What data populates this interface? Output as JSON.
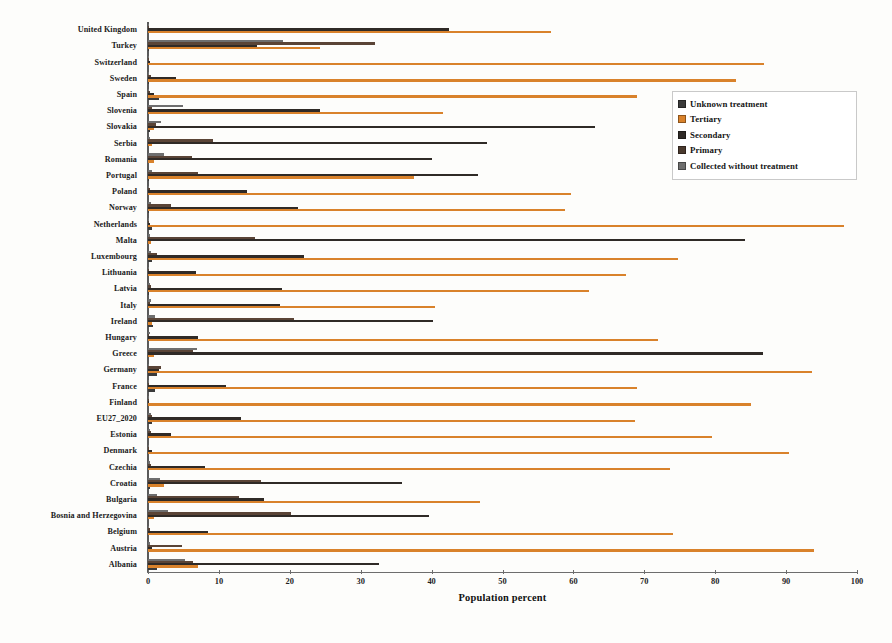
{
  "chart_data": {
    "type": "bar",
    "orientation": "horizontal",
    "title": "",
    "xlabel": "Population percent",
    "ylabel": "",
    "xlim": [
      0,
      100
    ],
    "xticks": [
      0,
      10,
      20,
      30,
      40,
      50,
      60,
      70,
      80,
      90,
      100
    ],
    "grid": false,
    "legend_position": "upper right",
    "colors": {
      "Unknown treatment": "#3a3a3a",
      "Tertiary": "#d9822b",
      "Secondary": "#2f2a26",
      "Primary": "#5a4436",
      "Collected without treatment": "#6e6e6e"
    },
    "series_order": [
      "Collected without treatment",
      "Primary",
      "Secondary",
      "Tertiary",
      "Unknown treatment"
    ],
    "categories": [
      "United Kingdom",
      "Turkey",
      "Switzerland",
      "Sweden",
      "Spain",
      "Slovenia",
      "Slovakia",
      "Serbia",
      "Romania",
      "Portugal",
      "Poland",
      "Norway",
      "Netherlands",
      "Malta",
      "Luxembourg",
      "Lithuania",
      "Latvia",
      "Italy",
      "Ireland",
      "Hungary",
      "Greece",
      "Germany",
      "France",
      "Finland",
      "EU27_2020",
      "Estonia",
      "Denmark",
      "Czechia",
      "Croatia",
      "Bulgaria",
      "Bosnia and Herzegovina",
      "Belgium",
      "Austria",
      "Albania"
    ],
    "series": [
      {
        "name": "Unknown treatment",
        "values": [
          0,
          0.2,
          0,
          0.1,
          1.6,
          0,
          0.3,
          0,
          0,
          0.2,
          0,
          0.2,
          0.5,
          0,
          0.6,
          0,
          0.2,
          0,
          0.7,
          0,
          0,
          1.3,
          1.0,
          0,
          0.5,
          0,
          0,
          0,
          0.3,
          0,
          0,
          0,
          0,
          1.2
        ]
      },
      {
        "name": "Tertiary",
        "values": [
          56.9,
          24.3,
          86.9,
          83.0,
          69.0,
          41.6,
          0.8,
          0.6,
          0.9,
          37.5,
          59.6,
          58.8,
          98.2,
          0.4,
          74.8,
          67.4,
          62.2,
          40.5,
          0.6,
          71.9,
          0.9,
          93.6,
          69.0,
          85.0,
          68.7,
          79.6,
          90.4,
          73.6,
          2.2,
          46.8,
          0.8,
          74.0,
          93.9,
          7.0
        ]
      },
      {
        "name": "Secondary",
        "values": [
          42.5,
          15.4,
          0.3,
          3.9,
          0.9,
          24.3,
          63.0,
          47.8,
          40.0,
          46.5,
          14.0,
          21.2,
          0.3,
          84.2,
          22.0,
          6.8,
          18.9,
          18.6,
          40.2,
          7.1,
          86.7,
          1.5,
          11.0,
          0.2,
          13.1,
          3.2,
          0.6,
          8.0,
          35.8,
          16.3,
          39.6,
          8.4,
          0.5,
          32.6
        ]
      },
      {
        "name": "Primary",
        "values": [
          0.2,
          32.0,
          0.2,
          0.4,
          0.3,
          0.5,
          1.1,
          9.1,
          6.2,
          7.1,
          0.3,
          3.2,
          0.2,
          15.1,
          1.3,
          0.2,
          0.4,
          0.3,
          20.6,
          0.2,
          6.4,
          1.8,
          0.2,
          0.2,
          0.5,
          0.4,
          0.2,
          0.4,
          15.9,
          12.8,
          20.2,
          0.3,
          4.8,
          6.4
        ]
      },
      {
        "name": "Collected without treatment",
        "values": [
          0.1,
          19.0,
          0.1,
          0.2,
          0.2,
          5.0,
          1.8,
          0.3,
          2.2,
          0.5,
          0.2,
          0.4,
          0.1,
          0.3,
          0.4,
          0.2,
          0.3,
          0.4,
          1.0,
          0.3,
          6.9,
          0.2,
          0.2,
          0.1,
          0.4,
          0.3,
          0.2,
          0.3,
          1.7,
          1.3,
          2.8,
          0.2,
          0.3,
          5.2
        ]
      }
    ]
  },
  "legend": {
    "items": [
      {
        "label": "Unknown treatment",
        "color": "#3a3a3a"
      },
      {
        "label": "Tertiary",
        "color": "#d9822b"
      },
      {
        "label": "Secondary",
        "color": "#2f2a26"
      },
      {
        "label": "Primary",
        "color": "#4a3a2e"
      },
      {
        "label": "Collected without treatment",
        "color": "#6e6e6e"
      }
    ]
  }
}
